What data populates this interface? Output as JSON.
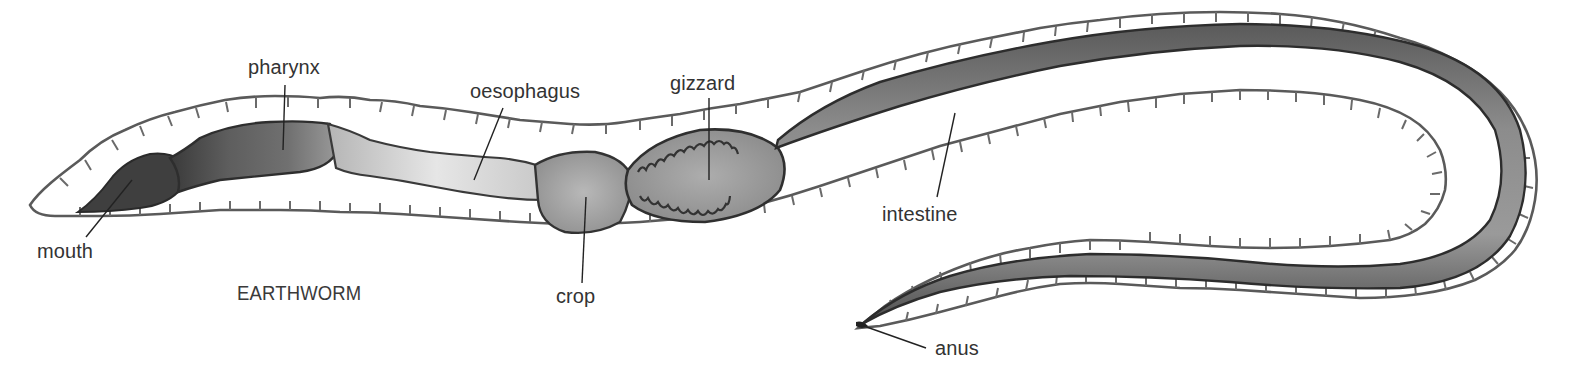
{
  "diagram": {
    "title": "EARTHWORM",
    "colors": {
      "background": "#ffffff",
      "body_outline": "#555555",
      "body_fill": "#ffffff",
      "mouth_fill": "#3f3f3f",
      "pharynx_fill": "#6e6e6e",
      "oesophagus_fill": "#d6d6d6",
      "crop_fill": "#a9a9a9",
      "gizzard_fill": "#a0a0a0",
      "intestine_fill": "#7d7d7d",
      "label_text": "#333333"
    },
    "labels": {
      "mouth": "mouth",
      "pharynx": "pharynx",
      "oesophagus": "oesophagus",
      "gizzard": "gizzard",
      "crop": "crop",
      "intestine": "intestine",
      "anus": "anus"
    }
  }
}
